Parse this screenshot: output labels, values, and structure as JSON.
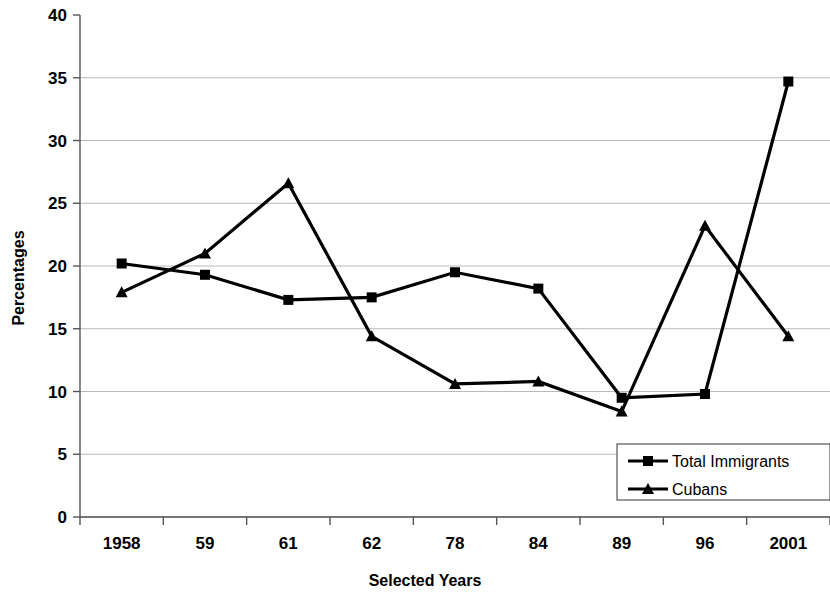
{
  "chart_data": {
    "type": "line",
    "title": "",
    "xlabel": "Selected Years",
    "ylabel": "Percentages",
    "categories": [
      "1958",
      "59",
      "61",
      "62",
      "78",
      "84",
      "89",
      "96",
      "2001"
    ],
    "series": [
      {
        "name": "Total Immigrants",
        "marker": "square",
        "color": "#000000",
        "values": [
          20.2,
          19.3,
          17.3,
          17.5,
          19.5,
          18.2,
          9.5,
          9.8,
          34.7
        ]
      },
      {
        "name": "Cubans",
        "marker": "triangle",
        "color": "#000000",
        "values": [
          17.9,
          21.0,
          26.6,
          14.4,
          10.6,
          10.8,
          8.4,
          23.2,
          14.4
        ]
      }
    ],
    "ylim": [
      0,
      40
    ],
    "yticks": [
      0,
      5,
      10,
      15,
      20,
      25,
      30,
      35,
      40
    ],
    "ytick_labels": [
      "0",
      "5",
      "10",
      "15",
      "20",
      "25",
      "30",
      "35",
      "40"
    ],
    "grid": true,
    "grid_axis": "y",
    "legend_position": "bottom-right",
    "legend_entries": [
      "Total Immigrants",
      "Cubans"
    ]
  }
}
